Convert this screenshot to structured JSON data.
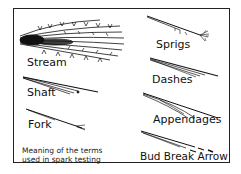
{
  "diagram": {
    "title_caption": [
      "Meaning of the terms",
      "used in spark testing"
    ],
    "terms": [
      {
        "id": "stream",
        "label": "Stream"
      },
      {
        "id": "shaft",
        "label": "Shaft"
      },
      {
        "id": "fork",
        "label": "Fork"
      },
      {
        "id": "sprigs",
        "label": "Sprigs"
      },
      {
        "id": "dashes",
        "label": "Dashes"
      },
      {
        "id": "appendages",
        "label": "Appendages"
      },
      {
        "id": "bud-break-arrow",
        "label": "Bud Break Arrow"
      }
    ],
    "colors": {
      "ink": "#111111",
      "background": "#ffffff"
    }
  }
}
